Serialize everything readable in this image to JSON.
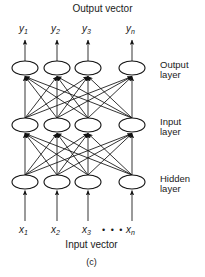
{
  "figure": {
    "caption": "(c)",
    "top_title": "Output vector",
    "bottom_title": "Input vector",
    "ellipsis": "• • •",
    "stroke_color": "#111111",
    "background_color": "#ffffff"
  },
  "output_labels": [
    {
      "base": "y",
      "sub": "1"
    },
    {
      "base": "y",
      "sub": "2"
    },
    {
      "base": "y",
      "sub": "3"
    },
    {
      "base": "y",
      "sub": "n"
    }
  ],
  "input_labels": [
    {
      "base": "x",
      "sub": "1"
    },
    {
      "base": "x",
      "sub": "2"
    },
    {
      "base": "x",
      "sub": "3"
    },
    {
      "base": "x",
      "sub": "n"
    }
  ],
  "layers": [
    {
      "name": "output",
      "line1": "Output",
      "line2": "layer",
      "node_count": 4
    },
    {
      "name": "input",
      "line1": "Input",
      "line2": "layer",
      "node_count": 4
    },
    {
      "name": "hidden",
      "line1": "Hidden",
      "line2": "layer",
      "node_count": 4
    }
  ],
  "chart_data": {
    "type": "diagram",
    "node_columns_x": [
      25,
      57,
      88,
      132
    ],
    "layer_rows_y": [
      68,
      125,
      182
    ],
    "node_rx": 13,
    "node_ry": 7,
    "connections": "fully-connected, arrows point upward from lower layer to upper layer",
    "top_arrows": "one vertical up-arrow from each output node to its y label",
    "bottom_arrows": "one vertical up-arrow from each x label to its hidden node"
  }
}
